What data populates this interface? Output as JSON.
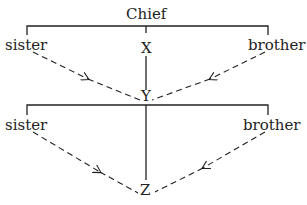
{
  "diagram": {
    "top": "Chief",
    "gen1": {
      "left": "sister",
      "center": "X",
      "right": "brother"
    },
    "gen2": {
      "center": "Y",
      "left": "sister",
      "right": "brother"
    },
    "gen3": {
      "center": "Z"
    }
  }
}
